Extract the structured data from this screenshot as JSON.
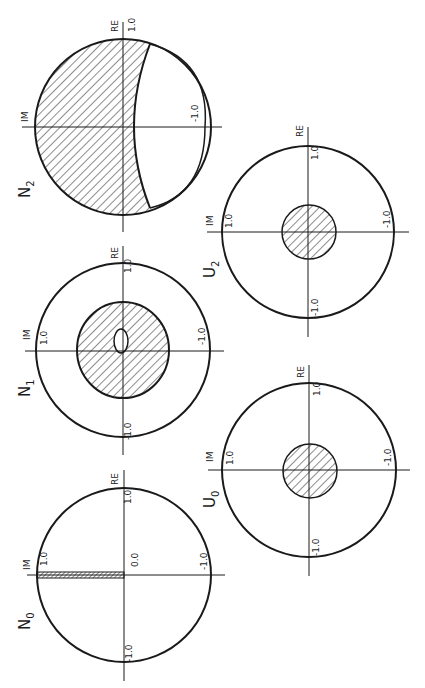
{
  "figure": {
    "axis_labels": {
      "real": "RE",
      "imaginary": "IM"
    },
    "panels": [
      {
        "id": "N2",
        "label": "N",
        "subscript": "2",
        "ticks": {
          "re_pos": "1.0",
          "re_neg": "-1.0"
        },
        "region": "crescent hatched region; unhatched lens toward -1.0"
      },
      {
        "id": "N1",
        "label": "N",
        "subscript": "1",
        "ticks": {
          "re_pos": "1.0",
          "re_neg": "-1.0",
          "im_pos": "1.0",
          "im_neg": "-1.0"
        },
        "region": "hatched disk with small unhatched hole near origin"
      },
      {
        "id": "N0",
        "label": "N",
        "subscript": "0",
        "ticks": {
          "re_pos": "1.0",
          "origin": "0.0",
          "re_neg": "-1.0",
          "im_pos": "1.0",
          "im_neg": "-1.0"
        },
        "region": "thin hatched strip along imaginary axis from 0.0 to 1.0"
      },
      {
        "id": "U2",
        "label": "U",
        "subscript": "2",
        "ticks": {
          "re_pos": "1.0",
          "re_neg": "-1.0",
          "im_pos": "1.0",
          "im_neg": "-1.0"
        },
        "region": "small hatched disk centered at origin"
      },
      {
        "id": "U0",
        "label": "U",
        "subscript": "0",
        "ticks": {
          "re_pos": "1.0",
          "re_neg": "-1.0",
          "im_pos": "1.0",
          "im_neg": "-1.0"
        },
        "region": "small hatched disk centered at origin"
      }
    ]
  }
}
